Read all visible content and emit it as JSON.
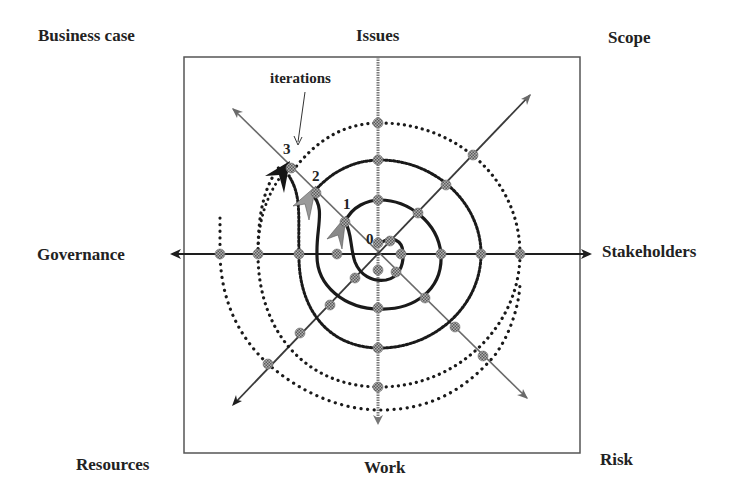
{
  "labels": {
    "top_left": "Business case",
    "top": "Issues",
    "top_right": "Scope",
    "left": "Governance",
    "right": "Stakeholders",
    "bottom_left": "Resources",
    "bottom": "Work",
    "bottom_right": "Risk"
  },
  "annotation": {
    "iterations": "iterations"
  },
  "iteration_numbers": [
    "0",
    "1",
    "2",
    "3"
  ],
  "colors": {
    "line": "#2a2a2a",
    "node": "#8a8a8a",
    "arrow_light": "#8c8c8c",
    "arrow_dark": "#151515",
    "box": "#555555"
  },
  "geometry": {
    "center": [
      378,
      254
    ],
    "box": [
      184,
      57,
      580,
      453
    ]
  }
}
